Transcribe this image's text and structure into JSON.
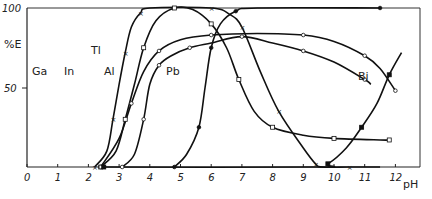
{
  "chart_data": {
    "type": "line",
    "title": "",
    "xlabel": "pH",
    "ylabel": "%E",
    "xlim": [
      0,
      13
    ],
    "ylim": [
      0,
      100
    ],
    "x_ticks": [
      "0",
      "1",
      "2",
      "3",
      "4",
      "5",
      "6",
      "7",
      "8",
      "9",
      "10",
      "11",
      "12"
    ],
    "y_ticks": [
      "50",
      "100"
    ],
    "grid": false,
    "legend": "inline labels on curves",
    "series": [
      {
        "name": "Ga",
        "marker": "x",
        "points": [
          [
            2.2,
            0
          ],
          [
            2.6,
            10
          ],
          [
            2.8,
            30
          ],
          [
            3.0,
            52
          ],
          [
            3.2,
            72
          ],
          [
            3.4,
            88
          ],
          [
            3.7,
            97
          ],
          [
            4.0,
            100
          ],
          [
            6.0,
            100
          ],
          [
            6.6,
            96
          ],
          [
            7.0,
            88
          ],
          [
            7.6,
            60
          ],
          [
            8.2,
            35
          ],
          [
            9.0,
            12
          ],
          [
            9.4,
            2
          ],
          [
            9.6,
            0
          ],
          [
            10.5,
            0
          ],
          [
            11.5,
            0
          ]
        ]
      },
      {
        "name": "In",
        "marker": "open-square",
        "points": [
          [
            2.4,
            0
          ],
          [
            2.9,
            10
          ],
          [
            3.2,
            30
          ],
          [
            3.5,
            52
          ],
          [
            3.8,
            75
          ],
          [
            4.2,
            92
          ],
          [
            4.8,
            100
          ],
          [
            5.4,
            99
          ],
          [
            6.0,
            90
          ],
          [
            6.5,
            75
          ],
          [
            6.9,
            55
          ],
          [
            7.4,
            35
          ],
          [
            8.0,
            25
          ],
          [
            9.0,
            20
          ],
          [
            10.0,
            18
          ],
          [
            11.5,
            17
          ],
          [
            11.8,
            17
          ]
        ]
      },
      {
        "name": "Tl",
        "marker": "open-circle",
        "points": [
          [
            2.4,
            0
          ],
          [
            3.0,
            18
          ],
          [
            3.4,
            40
          ],
          [
            3.8,
            60
          ],
          [
            4.3,
            73
          ],
          [
            5.0,
            80
          ],
          [
            6.0,
            83
          ],
          [
            7.5,
            84
          ],
          [
            9.0,
            83
          ],
          [
            10.0,
            79
          ],
          [
            11.0,
            70
          ],
          [
            11.5,
            62
          ],
          [
            12.0,
            48
          ]
        ]
      },
      {
        "name": "Al",
        "marker": "open-circle",
        "points": [
          [
            3.1,
            0
          ],
          [
            3.5,
            8
          ],
          [
            3.8,
            30
          ],
          [
            4.0,
            52
          ],
          [
            4.3,
            64
          ],
          [
            4.7,
            70
          ],
          [
            5.3,
            75
          ],
          [
            6.0,
            78
          ],
          [
            7.0,
            82
          ],
          [
            8.0,
            78
          ],
          [
            9.0,
            73
          ],
          [
            10.0,
            66
          ],
          [
            11.0,
            55
          ],
          [
            11.2,
            52
          ]
        ]
      },
      {
        "name": "Pb",
        "marker": "filled-circle",
        "points": [
          [
            4.8,
            0
          ],
          [
            5.2,
            8
          ],
          [
            5.6,
            25
          ],
          [
            5.8,
            50
          ],
          [
            6.0,
            75
          ],
          [
            6.3,
            90
          ],
          [
            6.8,
            98
          ],
          [
            7.5,
            100
          ],
          [
            11.5,
            100
          ]
        ]
      },
      {
        "name": "Bi",
        "marker": "filled-square",
        "points": [
          [
            2.5,
            0
          ],
          [
            9.4,
            0
          ],
          [
            9.8,
            2
          ],
          [
            10.4,
            12
          ],
          [
            10.9,
            25
          ],
          [
            11.4,
            40
          ],
          [
            11.8,
            58
          ],
          [
            12.2,
            72
          ]
        ]
      }
    ],
    "annotations": [
      "Ga",
      "In",
      "Tl",
      "Al",
      "Pb",
      "Bi"
    ]
  },
  "labels": {
    "ylabel": "%E",
    "xlabel": "pH",
    "y100": "100",
    "y50": "50",
    "ga": "Ga",
    "in": "In",
    "tl": "Tl",
    "al": "Al",
    "pb": "Pb",
    "bi": "Bi"
  }
}
